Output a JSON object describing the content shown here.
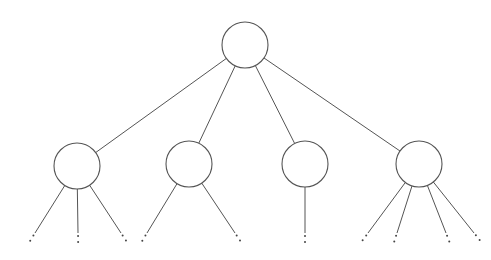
{
  "diagram": {
    "type": "tree",
    "colors": {
      "stroke": "#555555",
      "background": "#ffffff",
      "dots": "#444444"
    },
    "root": {
      "id": "root",
      "label": "",
      "children": [
        {
          "id": "child-1",
          "label": "",
          "truncated_children": 3
        },
        {
          "id": "child-2",
          "label": "",
          "truncated_children": 2
        },
        {
          "id": "child-3",
          "label": "",
          "truncated_children": 1
        },
        {
          "id": "child-4",
          "label": "",
          "truncated_children": 4
        }
      ]
    },
    "continuation_marker": "vertical-ellipsis"
  }
}
